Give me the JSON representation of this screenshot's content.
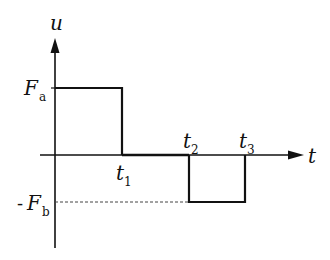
{
  "diagram": {
    "type": "piecewise-constant signal (two rectangular pulses)",
    "axes": {
      "y_label": "u",
      "x_label": "t"
    },
    "levels": {
      "positive": {
        "label": "F",
        "subscript": "a",
        "prefix": ""
      },
      "negative": {
        "label": "F",
        "subscript": "b",
        "prefix": "-"
      }
    },
    "time_marks": [
      {
        "label": "t",
        "subscript": "1"
      },
      {
        "label": "t",
        "subscript": "2"
      },
      {
        "label": "t",
        "subscript": "3"
      }
    ],
    "segments": [
      {
        "from": "0",
        "to": "t1",
        "value": "Fa"
      },
      {
        "from": "t1",
        "to": "t2",
        "value": "0"
      },
      {
        "from": "t2",
        "to": "t3",
        "value": "-Fb"
      },
      {
        "from": "t3",
        "to": "end",
        "value": "0"
      }
    ],
    "colors": {
      "line": "#111111",
      "dashed": "#444444",
      "background": "#ffffff"
    }
  }
}
